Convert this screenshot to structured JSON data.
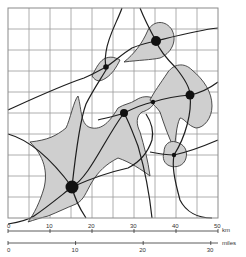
{
  "map": {
    "grid": {
      "x0": 8,
      "y0": 8,
      "cell": 21,
      "cols": 10,
      "rows": 10
    },
    "colors": {
      "region_fill": "#cfcfcf",
      "line": "#1e1e1e",
      "grid": "#9a9a9a"
    },
    "nodes": [
      {
        "id": "major-southwest",
        "x": 72,
        "y": 187,
        "r": 6.5
      },
      {
        "id": "major-north",
        "x": 156,
        "y": 41,
        "r": 5
      },
      {
        "id": "major-east",
        "x": 190,
        "y": 95,
        "r": 4.5
      },
      {
        "id": "mid-center",
        "x": 124,
        "y": 113,
        "r": 4
      },
      {
        "id": "small-northwest",
        "x": 106,
        "y": 67,
        "r": 2.8
      },
      {
        "id": "small-center-east",
        "x": 153,
        "y": 102,
        "r": 2.2
      },
      {
        "id": "small-southeast",
        "x": 174,
        "y": 155,
        "r": 2.2
      }
    ]
  },
  "scale": {
    "km_label": "km",
    "miles_label": "miles",
    "km_ticks": [
      "0",
      "10",
      "20",
      "30",
      "40",
      "50"
    ],
    "mile_ticks": [
      "0",
      "10",
      "20",
      "30"
    ]
  }
}
